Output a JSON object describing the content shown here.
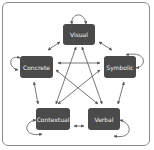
{
  "diagram": {
    "nodes": [
      {
        "id": "visual",
        "label": "Visual"
      },
      {
        "id": "concrete",
        "label": "Concrete"
      },
      {
        "id": "symbolic",
        "label": "Symbolic"
      },
      {
        "id": "contextual",
        "label": "Contextual"
      },
      {
        "id": "verbal",
        "label": "Verbal"
      }
    ],
    "edges": [
      {
        "from": "visual",
        "to": "visual",
        "type": "self-loop"
      },
      {
        "from": "concrete",
        "to": "concrete",
        "type": "self-loop"
      },
      {
        "from": "symbolic",
        "to": "symbolic",
        "type": "self-loop"
      },
      {
        "from": "contextual",
        "to": "contextual",
        "type": "self-loop"
      },
      {
        "from": "verbal",
        "to": "verbal",
        "type": "self-loop"
      },
      {
        "from": "visual",
        "to": "concrete",
        "type": "bidirectional"
      },
      {
        "from": "visual",
        "to": "symbolic",
        "type": "bidirectional"
      },
      {
        "from": "concrete",
        "to": "contextual",
        "type": "bidirectional"
      },
      {
        "from": "symbolic",
        "to": "verbal",
        "type": "bidirectional"
      },
      {
        "from": "contextual",
        "to": "verbal",
        "type": "bidirectional"
      },
      {
        "from": "visual",
        "to": "contextual",
        "type": "bidirectional"
      },
      {
        "from": "visual",
        "to": "verbal",
        "type": "bidirectional"
      },
      {
        "from": "concrete",
        "to": "symbolic",
        "type": "bidirectional"
      },
      {
        "from": "concrete",
        "to": "verbal",
        "type": "bidirectional"
      },
      {
        "from": "symbolic",
        "to": "contextual",
        "type": "bidirectional"
      }
    ],
    "colors": {
      "node_fill": "#4a4a4a",
      "node_text": "#f2f2f2",
      "edge": "#555555",
      "frame": "#8a8a8a"
    }
  }
}
